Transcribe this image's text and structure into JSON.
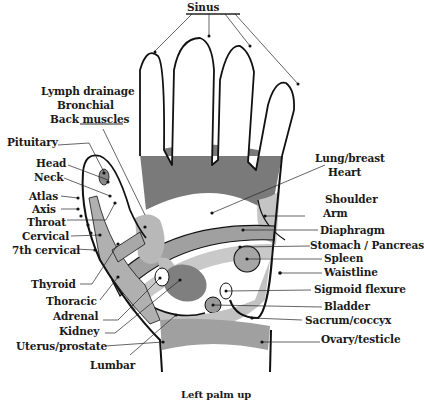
{
  "diagram": {
    "title": "Left palm up",
    "colors": {
      "outline": "#111111",
      "dark_band": "#7a7a7a",
      "mid_band": "#a8a8a8",
      "light_band": "#c9c9c9",
      "background": "#ffffff"
    },
    "labels_top": {
      "sinus": "Sinus"
    },
    "labels_left": {
      "lymph_drainage": "Lymph drainage",
      "bronchial": "Bronchial",
      "back_muscles": "Back muscles",
      "pituitary": "Pituitary",
      "head": "Head",
      "neck": "Neck",
      "atlas": "Atlas",
      "axis": "Axis",
      "throat": "Throat",
      "cervical": "Cervical",
      "seventh_cervical": "7th cervical",
      "thyroid": "Thyroid",
      "thoracic": "Thoracic",
      "adrenal": "Adrenal",
      "kidney": "Kidney",
      "uterus_prostate": "Uterus/prostate",
      "lumbar": "Lumbar"
    },
    "labels_right": {
      "lung_breast": "Lung/breast",
      "heart": "Heart",
      "shoulder": "Shoulder",
      "arm": "Arm",
      "diaphragm": "Diaphragm",
      "stomach_pancreas": "Stomach / Pancreas",
      "spleen": "Spleen",
      "waistline": "Waistline",
      "sigmoid_flexure": "Sigmoid flexure",
      "bladder": "Bladder",
      "sacrum_coccyx": "Sacrum/coccyx",
      "ovary_testicle": "Ovary/testicle"
    }
  }
}
